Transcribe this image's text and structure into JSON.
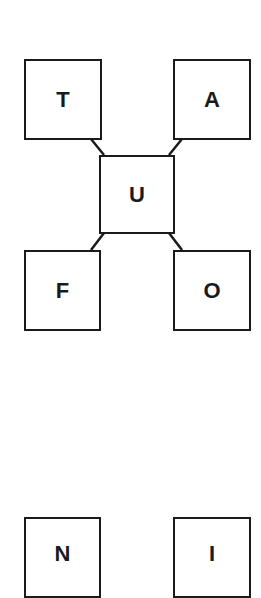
{
  "diagram": {
    "nodes": [
      {
        "id": "T",
        "label": "T",
        "x": 24,
        "y": 59,
        "w": 77,
        "h": 80
      },
      {
        "id": "A",
        "label": "A",
        "x": 173,
        "y": 59,
        "w": 77,
        "h": 80
      },
      {
        "id": "U",
        "label": "U",
        "x": 99,
        "y": 155,
        "w": 75,
        "h": 78
      },
      {
        "id": "F",
        "label": "F",
        "x": 24,
        "y": 250,
        "w": 76,
        "h": 80
      },
      {
        "id": "O",
        "label": "O",
        "x": 173,
        "y": 250,
        "w": 77,
        "h": 80
      },
      {
        "id": "N",
        "label": "N",
        "x": 24,
        "y": 517,
        "w": 76,
        "h": 80
      },
      {
        "id": "I",
        "label": "I",
        "x": 173,
        "y": 517,
        "w": 77,
        "h": 80
      }
    ],
    "edges": [
      {
        "from": "T",
        "to": "U"
      },
      {
        "from": "A",
        "to": "U"
      },
      {
        "from": "U",
        "to": "F"
      },
      {
        "from": "U",
        "to": "O"
      }
    ],
    "colors": {
      "stroke": "#1a1a1a",
      "background": "#ffffff"
    }
  }
}
